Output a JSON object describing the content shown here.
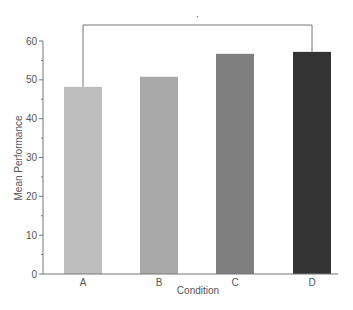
{
  "chart_data": {
    "type": "bar",
    "title": "",
    "xlabel": "Condition",
    "ylabel": "Mean Performance",
    "categories": [
      "A",
      "B",
      "C",
      "D"
    ],
    "values": [
      48.2,
      50.8,
      56.7,
      57.2
    ],
    "colors": [
      "#bdbdbd",
      "#a9a9a9",
      "#7f7f7f",
      "#333333"
    ],
    "ylim": [
      0,
      60
    ],
    "yticks": [
      0,
      10,
      20,
      30,
      40,
      50,
      60
    ],
    "yminor_step": 5,
    "grid": false,
    "legend": null,
    "annotations": [
      {
        "type": "significance-bracket",
        "from": "A",
        "to": "D",
        "label": "*"
      }
    ]
  }
}
